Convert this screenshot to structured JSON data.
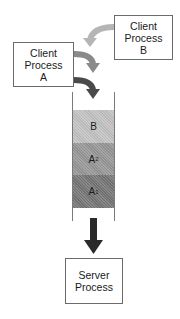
{
  "diagram": {
    "client_a": {
      "line1": "Client",
      "line2": "Process",
      "line3": "A"
    },
    "client_b": {
      "line1": "Client",
      "line2": "Process",
      "line3": "B"
    },
    "server": {
      "line1": "Server",
      "line2": "Process"
    },
    "queue": {
      "slots": [
        {
          "label": "B",
          "subscript": "",
          "color": "#b9b9b9"
        },
        {
          "label": "A",
          "subscript": "2",
          "color": "#8f8f8f"
        },
        {
          "label": "A",
          "subscript": "1",
          "color": "#6f6f6f"
        }
      ]
    },
    "arrows": {
      "from_b_color": "#b5b5b5",
      "from_a_top_color": "#8a8a8a",
      "from_a_bottom_color": "#4a4a4a",
      "to_server_color": "#2a2a2a"
    }
  }
}
